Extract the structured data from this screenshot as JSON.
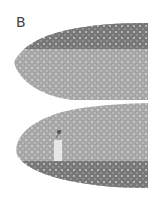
{
  "figure": {
    "label": "B",
    "colors": {
      "background": "#ffffff",
      "dark_fabric": "#7a7a7a",
      "light_fabric": "#a8a8a8",
      "dots": "#d8d8d8",
      "tag": "#e8e8e8"
    }
  }
}
